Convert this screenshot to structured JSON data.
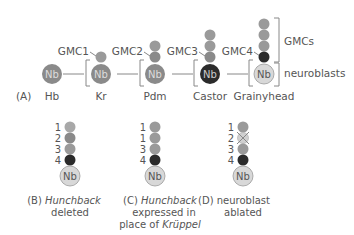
{
  "colors": {
    "nb_gray": "#8a8a8a",
    "gmc_gray": "#9a9a9a",
    "dark": "#2b2b2b",
    "light": "#d8d8d8",
    "line": "#888888",
    "text": "#555555"
  },
  "panel_a": {
    "label": "(A)",
    "stages": [
      {
        "name": "Hb",
        "nb": "Nb"
      },
      {
        "name": "Kr",
        "nb": "Nb",
        "gmc": "GMC1"
      },
      {
        "name": "Pdm",
        "nb": "Nb",
        "gmc": "GMC2"
      },
      {
        "name": "Castor",
        "nb": "Nb",
        "gmc": "GMC3"
      },
      {
        "name": "Grainyhead",
        "nb": "Nb",
        "gmc": "GMC4"
      }
    ],
    "bracket_gmcs": "GMCs",
    "bracket_neuroblasts": "neuroblasts"
  },
  "panel_b": {
    "numbers": [
      "1",
      "2",
      "3",
      "4"
    ],
    "nb": "Nb",
    "caption_prefix": "(B) ",
    "caption_italic": "Hunchback",
    "caption_line2": "deleted"
  },
  "panel_c": {
    "numbers": [
      "1",
      "1",
      "3",
      "4"
    ],
    "nb": "Nb",
    "caption_prefix": "(C) ",
    "caption_italic": "Hunchback",
    "caption_line2": "expressed in",
    "caption_line3_prefix": "place of ",
    "caption_line3_italic": "Krüppel"
  },
  "panel_d": {
    "numbers": [
      "1",
      "2",
      "3",
      "4"
    ],
    "nb": "Nb",
    "caption_line1": "(D) neuroblast",
    "caption_line2": "ablated"
  }
}
